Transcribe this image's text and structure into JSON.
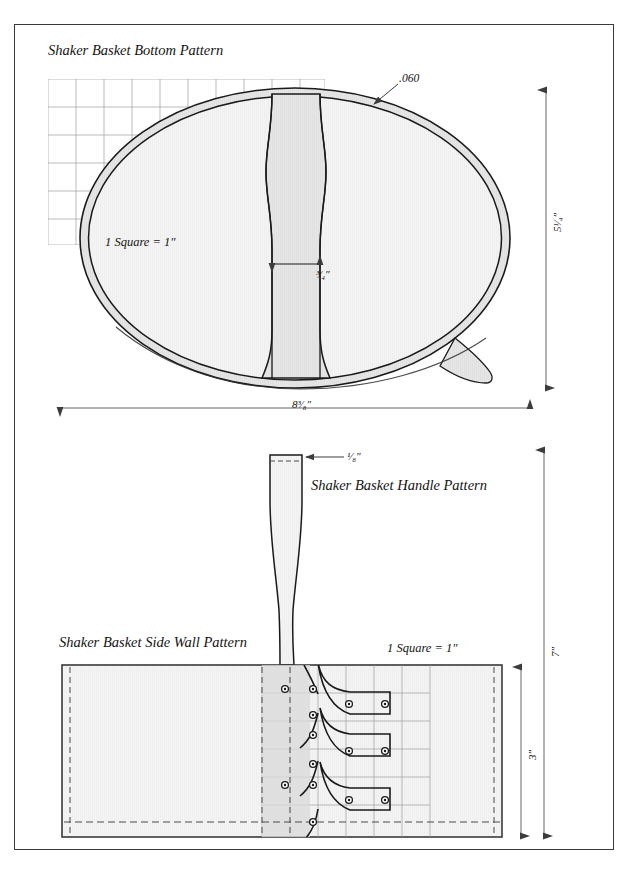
{
  "document": {
    "titles": {
      "bottom_pattern": "Shaker Basket Bottom Pattern",
      "handle_pattern": "Shaker Basket Handle Pattern",
      "side_wall_pattern": "Shaker Basket Side Wall Pattern"
    },
    "scale_notes": {
      "bottom": "1 Square = 1″",
      "side_wall": "1 Square = 1″"
    },
    "dimensions": {
      "rim_thickness": ".060",
      "bottom_height": "5¹⁄₄″",
      "bottom_width": "8³⁄₈″",
      "center_rib_width": "³⁄₄″",
      "handle_thickness": "¹⁄₈″",
      "side_wall_height": "3″",
      "overall_height": "7″"
    },
    "colors": {
      "ink": "#131313",
      "rim_fill": "#e0e0e0",
      "panel_fill": "#f2f2f2",
      "grid_line": "#9a9a9a",
      "border": "#3a3a3a",
      "dim_line": "#555555"
    },
    "icons": {
      "rim_leader": "leader-line",
      "arrow": "arrow-head",
      "peg": "peg-hole-circle"
    }
  }
}
